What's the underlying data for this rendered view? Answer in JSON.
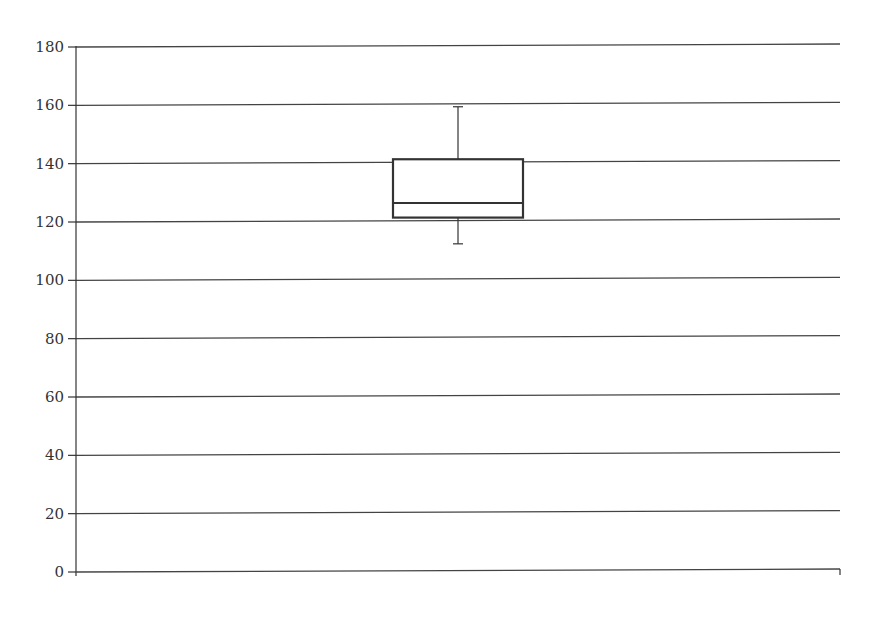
{
  "chart_data": {
    "type": "box",
    "title": "",
    "xlabel": "",
    "ylabel": "",
    "ylim": [
      0,
      180
    ],
    "yticks": [
      0,
      20,
      40,
      60,
      80,
      100,
      120,
      140,
      160,
      180
    ],
    "ytick_labels": [
      "0",
      "20",
      "40",
      "60",
      "80",
      "100",
      "120",
      "140",
      "160",
      "180"
    ],
    "grid": true,
    "legend": null,
    "series": [
      {
        "name": "",
        "min": 112,
        "q1": 121,
        "median": 126,
        "q3": 141,
        "max": 159
      }
    ]
  },
  "colors": {
    "line": "#333333",
    "grid": "#444444",
    "background": "#ffffff"
  }
}
